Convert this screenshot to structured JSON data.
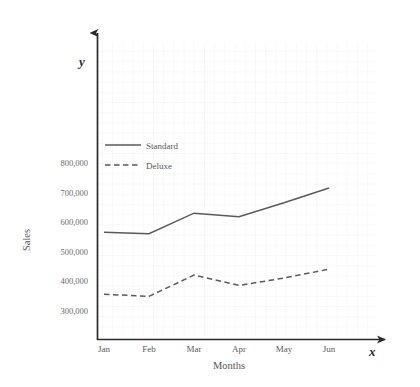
{
  "chart_data": {
    "type": "line",
    "title": "",
    "xlabel": "Months",
    "ylabel": "Sales",
    "x_axis_variable": "x",
    "y_axis_variable": "y",
    "categories": [
      "Jan",
      "Feb",
      "Mar",
      "Apr",
      "May",
      "Jun"
    ],
    "ylim": [
      250000,
      850000
    ],
    "yticks": [
      300000,
      400000,
      500000,
      600000,
      700000,
      800000
    ],
    "ytick_labels": [
      "300,000",
      "400,000",
      "500,000",
      "600,000",
      "700,000",
      "800,000"
    ],
    "grid": true,
    "legend_position": "upper-left-inside",
    "series": [
      {
        "name": "Standard",
        "style": "solid",
        "color": "#5a5a5a",
        "values": [
          565000,
          560000,
          630000,
          618000,
          665000,
          715000
        ]
      },
      {
        "name": "Deluxe",
        "style": "dashed",
        "color": "#5a5a5a",
        "values": [
          355000,
          348000,
          420000,
          385000,
          410000,
          440000
        ]
      }
    ]
  },
  "axes": {
    "y_label": "Sales",
    "x_label": "Months",
    "y_var": "y",
    "x_var": "x"
  },
  "legend": {
    "items": [
      {
        "label": "Standard",
        "style": "solid"
      },
      {
        "label": "Deluxe",
        "style": "dashed"
      }
    ]
  },
  "colors": {
    "line": "#5a5a5a",
    "axis": "#2b2b2b",
    "grid": "#f0eff0",
    "text": "#5a5a5a"
  }
}
